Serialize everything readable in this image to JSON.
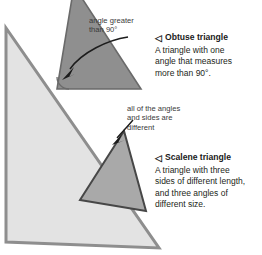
{
  "figure": {
    "kind": "triangle-types-diagram",
    "background": "#ffffff",
    "annotations": [
      {
        "id": "obtuse-angle-callout",
        "lines": [
          "angle greater",
          "than 90°"
        ],
        "text": "angle greater than 90°"
      },
      {
        "id": "scalene-callout",
        "lines": [
          "all of the angles",
          "and sides are",
          "different"
        ],
        "text": "all of the angles and sides are different"
      }
    ],
    "definitions": [
      {
        "id": "obtuse",
        "marker": "◁",
        "title": "Obtuse triangle",
        "body": "A triangle with one angle that measures more than 90°.",
        "body_lines": [
          "A triangle with one",
          "angle that measures",
          "more than 90°."
        ]
      },
      {
        "id": "scalene",
        "marker": "◁",
        "title": "Scalene triangle",
        "body": "A triangle with three sides of different length, and three angles of different size.",
        "body_lines": [
          "A triangle with three",
          "sides of different length,",
          "and three angles of",
          "different size."
        ]
      }
    ],
    "shapes": [
      {
        "id": "large-light-triangle",
        "role": "background-triangle",
        "fill": "#e3e3e3",
        "stroke": "#8c8c8c"
      },
      {
        "id": "obtuse-triangle",
        "role": "obtuse-triangle",
        "fill": "#8f8f8f",
        "stroke": "#6e6e6e"
      },
      {
        "id": "scalene-triangle",
        "role": "scalene-triangle",
        "fill": "#a9a9a9",
        "stroke": "#4a4a4a"
      }
    ],
    "arrows": [
      {
        "id": "obtuse-angle-arrow",
        "points_to": "interior angle at lower-left of obtuse triangle"
      },
      {
        "id": "scalene-arrow",
        "points_to": "apex of scalene triangle"
      }
    ],
    "angle_mark": {
      "id": "obtuse-angle-arc",
      "shape": "arc"
    }
  }
}
